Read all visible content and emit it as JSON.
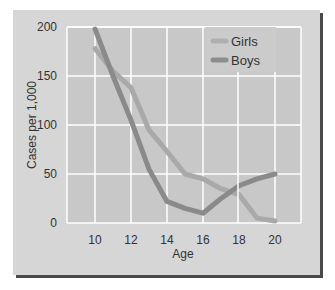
{
  "chart_data": {
    "type": "line",
    "title": "",
    "xlabel": "Age",
    "ylabel": "Cases per 1,000",
    "x": [
      10,
      11,
      12,
      13,
      14,
      15,
      16,
      17,
      18,
      19,
      20
    ],
    "xticks": [
      "10",
      "12",
      "14",
      "16",
      "18",
      "20"
    ],
    "yticks": [
      "0",
      "50",
      "100",
      "150",
      "200"
    ],
    "xlim": [
      8.4,
      21.4
    ],
    "ylim": [
      0,
      200
    ],
    "grid": true,
    "legend_position": "upper right",
    "series": [
      {
        "name": "Girls",
        "color": "#a9a9a9",
        "values": [
          178,
          155,
          138,
          95,
          73,
          50,
          45,
          35,
          29,
          5,
          2
        ]
      },
      {
        "name": "Boys",
        "color": "#8a8a8a",
        "values": [
          198,
          150,
          105,
          55,
          22,
          15,
          10,
          25,
          38,
          45,
          50
        ]
      }
    ]
  },
  "legend": {
    "girls_label": "Girls",
    "boys_label": "Boys"
  },
  "axes": {
    "xlabel": "Age",
    "ylabel": "Cases per 1,000"
  }
}
